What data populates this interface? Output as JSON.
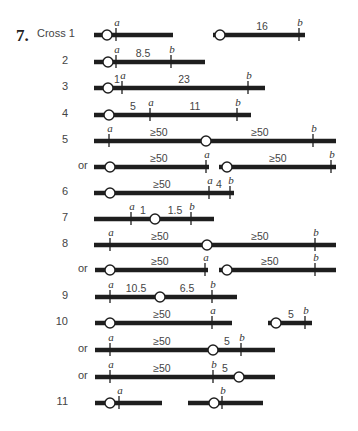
{
  "problem": {
    "number": "7.",
    "first_label": "Cross 1"
  },
  "colors": {
    "chromosome": "#1e1e1e",
    "centromere_fill": "#ffffff",
    "text": "#444444"
  },
  "rows": [
    {
      "label": "Cross 1",
      "y": 35,
      "segments": [
        {
          "x1": 94,
          "x2": 173,
          "centromere": 107,
          "ticks": [
            {
              "x": 116,
              "gene": "a"
            }
          ],
          "distances": []
        },
        {
          "x1": 213,
          "x2": 305,
          "centromere": 220,
          "ticks": [
            {
              "x": 299,
              "gene": "b"
            }
          ],
          "distances": [
            {
              "x": 262,
              "text": "16"
            }
          ]
        }
      ]
    },
    {
      "label": "2",
      "y": 62,
      "segments": [
        {
          "x1": 94,
          "x2": 205,
          "centromere": 108,
          "ticks": [
            {
              "x": 116,
              "gene": "a"
            },
            {
              "x": 171,
              "gene": "b"
            }
          ],
          "distances": [
            {
              "x": 143,
              "text": "8.5"
            }
          ]
        }
      ]
    },
    {
      "label": "3",
      "y": 88,
      "segments": [
        {
          "x1": 94,
          "x2": 265,
          "centromere": 108,
          "ticks": [
            {
              "x": 122,
              "gene": "a"
            },
            {
              "x": 248,
              "gene": "b"
            }
          ],
          "distances": [
            {
              "x": 117,
              "text": "1"
            },
            {
              "x": 184,
              "text": "23"
            }
          ]
        }
      ]
    },
    {
      "label": "4",
      "y": 115,
      "segments": [
        {
          "x1": 94,
          "x2": 251,
          "centromere": 109,
          "ticks": [
            {
              "x": 150,
              "gene": "a"
            },
            {
              "x": 237,
              "gene": "b"
            }
          ],
          "distances": [
            {
              "x": 133,
              "text": "5"
            },
            {
              "x": 195,
              "text": "11"
            }
          ]
        }
      ]
    },
    {
      "label": "5",
      "y": 141,
      "segments": [
        {
          "x1": 94,
          "x2": 336,
          "centromere": 206,
          "ticks": [
            {
              "x": 109,
              "gene": "a"
            },
            {
              "x": 313,
              "gene": "b"
            }
          ],
          "distances": [
            {
              "x": 159,
              "text": "≥50"
            },
            {
              "x": 260,
              "text": "≥50"
            }
          ]
        }
      ]
    },
    {
      "label": "or",
      "y": 167,
      "segments": [
        {
          "x1": 94,
          "x2": 209,
          "centromere": 110,
          "ticks": [
            {
              "x": 206,
              "gene": "a"
            }
          ],
          "distances": [
            {
              "x": 159,
              "text": "≥50"
            }
          ]
        },
        {
          "x1": 219,
          "x2": 336,
          "centromere": 227,
          "ticks": [
            {
              "x": 331,
              "gene": "b"
            }
          ],
          "distances": [
            {
              "x": 278,
              "text": "≥50"
            }
          ]
        }
      ]
    },
    {
      "label": "6",
      "y": 193,
      "segments": [
        {
          "x1": 94,
          "x2": 234,
          "centromere": 110,
          "ticks": [
            {
              "x": 209,
              "gene": "a"
            },
            {
              "x": 230,
              "gene": "b"
            }
          ],
          "distances": [
            {
              "x": 162,
              "text": "≥50"
            },
            {
              "x": 219,
              "text": "4"
            }
          ]
        }
      ]
    },
    {
      "label": "7",
      "y": 219,
      "segments": [
        {
          "x1": 94,
          "x2": 214,
          "centromere": 155,
          "ticks": [
            {
              "x": 131,
              "gene": "a"
            },
            {
              "x": 191,
              "gene": "b"
            }
          ],
          "distances": [
            {
              "x": 143,
              "text": "1"
            },
            {
              "x": 175,
              "text": "1.5"
            }
          ]
        }
      ]
    },
    {
      "label": "8",
      "y": 245,
      "segments": [
        {
          "x1": 94,
          "x2": 336,
          "centromere": 207,
          "ticks": [
            {
              "x": 110,
              "gene": "a"
            },
            {
              "x": 315,
              "gene": "b"
            }
          ],
          "distances": [
            {
              "x": 160,
              "text": "≥50"
            },
            {
              "x": 260,
              "text": "≥50"
            }
          ]
        }
      ]
    },
    {
      "label": "or",
      "y": 270,
      "segments": [
        {
          "x1": 95,
          "x2": 208,
          "centromere": 110,
          "ticks": [
            {
              "x": 205,
              "gene": "a"
            }
          ],
          "distances": [
            {
              "x": 160,
              "text": "≥50"
            }
          ]
        },
        {
          "x1": 219,
          "x2": 336,
          "centromere": 227,
          "ticks": [
            {
              "x": 315,
              "gene": "b"
            }
          ],
          "distances": [
            {
              "x": 270,
              "text": "≥50"
            }
          ]
        }
      ]
    },
    {
      "label": "9",
      "y": 297,
      "segments": [
        {
          "x1": 95,
          "x2": 237,
          "centromere": 160,
          "ticks": [
            {
              "x": 110,
              "gene": "a"
            },
            {
              "x": 212,
              "gene": "b"
            }
          ],
          "distances": [
            {
              "x": 136,
              "text": "10.5"
            },
            {
              "x": 187,
              "text": "6.5"
            }
          ]
        }
      ]
    },
    {
      "label": "10",
      "y": 323,
      "segments": [
        {
          "x1": 95,
          "x2": 232,
          "centromere": 110,
          "ticks": [
            {
              "x": 212,
              "gene": "a"
            }
          ],
          "distances": [
            {
              "x": 162,
              "text": "≥50"
            }
          ]
        },
        {
          "x1": 268,
          "x2": 312,
          "centromere": 276,
          "ticks": [
            {
              "x": 305,
              "gene": "b"
            }
          ],
          "distances": [
            {
              "x": 291,
              "text": "5"
            }
          ]
        }
      ]
    },
    {
      "label": "or",
      "y": 350,
      "segments": [
        {
          "x1": 95,
          "x2": 275,
          "centromere": 213,
          "ticks": [
            {
              "x": 110,
              "gene": "a"
            },
            {
              "x": 241,
              "gene": "b"
            }
          ],
          "distances": [
            {
              "x": 162,
              "text": "≥50"
            },
            {
              "x": 227,
              "text": "5"
            }
          ]
        }
      ]
    },
    {
      "label": "or",
      "y": 377,
      "segments": [
        {
          "x1": 95,
          "x2": 275,
          "centromere": 239,
          "ticks": [
            {
              "x": 110,
              "gene": "a"
            },
            {
              "x": 213,
              "gene": "b"
            }
          ],
          "distances": [
            {
              "x": 162,
              "text": "≥50"
            },
            {
              "x": 225,
              "text": "5"
            }
          ]
        }
      ]
    },
    {
      "label": "11",
      "y": 403,
      "segments": [
        {
          "x1": 95,
          "x2": 162,
          "centromere": 110,
          "ticks": [
            {
              "x": 119,
              "gene": "a"
            }
          ],
          "distances": []
        },
        {
          "x1": 188,
          "x2": 263,
          "centromere": 214,
          "ticks": [
            {
              "x": 222,
              "gene": "b"
            }
          ],
          "distances": []
        }
      ]
    }
  ]
}
